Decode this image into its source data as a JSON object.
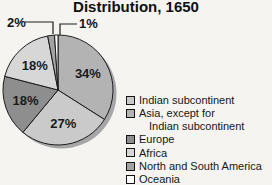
{
  "title": "Distribution, 1650",
  "chart_data": {
    "type": "pie",
    "title": "Distribution, 1650",
    "unit": "%",
    "start": "top",
    "direction": "clockwise",
    "legend_position": "right",
    "slices": [
      {
        "label": "Asia, except for Indian subcontinent",
        "value": 34,
        "pct": "34%",
        "color": "#b3b3b3"
      },
      {
        "label": "Indian subcontinent",
        "value": 27,
        "pct": "27%",
        "color": "#cacaca"
      },
      {
        "label": "Europe",
        "value": 18,
        "pct": "18%",
        "color": "#8e8e8e"
      },
      {
        "label": "Africa",
        "value": 18,
        "pct": "18%",
        "color": "#d7d7d7"
      },
      {
        "label": "North and South America",
        "value": 2,
        "pct": "2%",
        "color": "#a3a3a3"
      },
      {
        "label": "Oceania",
        "value": 1,
        "pct": "1%",
        "color": "#fdfdfd"
      }
    ]
  },
  "legend": {
    "items": [
      {
        "label": "Indian subcontinent",
        "color": "#cacaca"
      },
      {
        "label": "Asia, except for",
        "label_line2": "Indian subcontinent",
        "color": "#b3b3b3"
      },
      {
        "label": "Europe",
        "color": "#8e8e8e"
      },
      {
        "label": "Africa",
        "color": "#d7d7d7"
      },
      {
        "label": "North and South America",
        "color": "#a3a3a3"
      },
      {
        "label": "Oceania",
        "color": "#fdfdfd"
      }
    ]
  }
}
